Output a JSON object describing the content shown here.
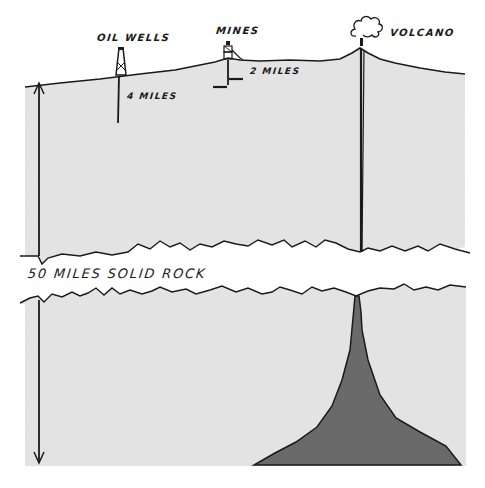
{
  "diagram": {
    "type": "cross-section",
    "colors": {
      "rock": "#e4e4e4",
      "rock_speckle": "#cfcfcf",
      "ink": "#1a1a1a",
      "magma": "#6a6a6a",
      "background": "#ffffff"
    },
    "labels": {
      "oil_wells": "OIL WELLS",
      "oil_depth": "4 MILES",
      "mines": "MINES",
      "mine_depth": "2 MILES",
      "volcano": "VOLCANO",
      "solid_rock": "50 MILES SOLID ROCK"
    },
    "features": [
      {
        "name": "oil-wells",
        "depth": "4 MILES"
      },
      {
        "name": "mines",
        "depth": "2 MILES"
      },
      {
        "name": "volcano",
        "depth": "conduit to magma chamber"
      },
      {
        "name": "solid-rock-gap",
        "depth": "50 MILES"
      },
      {
        "name": "magma-chamber"
      }
    ]
  }
}
